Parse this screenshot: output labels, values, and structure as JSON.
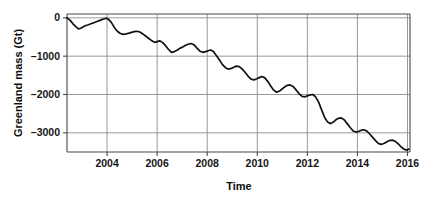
{
  "chart_data": {
    "type": "line",
    "title": "",
    "xlabel": "Time",
    "ylabel": "Greenland mass (Gt)",
    "xlim": [
      2002.4,
      2016.1
    ],
    "ylim": [
      -3500,
      100
    ],
    "grid": true,
    "legend": "none",
    "xticks": [
      2004,
      2006,
      2008,
      2010,
      2012,
      2014,
      2016
    ],
    "xtick_labels": [
      "2004",
      "2006",
      "2008",
      "2010",
      "2012",
      "2014",
      "2016"
    ],
    "yticks": [
      0,
      -1000,
      -2000,
      -3000
    ],
    "ytick_labels": [
      "0",
      "–1000",
      "–2000",
      "–3000"
    ],
    "series": [
      {
        "name": "Greenland ice sheet mass anomaly",
        "color": "#111111",
        "x": [
          2002.4,
          2002.52,
          2002.63,
          2002.75,
          2002.86,
          2002.95,
          2003.05,
          2003.15,
          2003.26,
          2003.38,
          2003.5,
          2003.62,
          2003.74,
          2003.86,
          2003.96,
          2004.06,
          2004.17,
          2004.29,
          2004.41,
          2004.53,
          2004.65,
          2004.77,
          2004.88,
          2004.98,
          2005.08,
          2005.19,
          2005.31,
          2005.43,
          2005.55,
          2005.67,
          2005.79,
          2005.9,
          2006.0,
          2006.1,
          2006.21,
          2006.33,
          2006.45,
          2006.57,
          2006.69,
          2006.81,
          2006.92,
          2007.02,
          2007.12,
          2007.23,
          2007.35,
          2007.47,
          2007.59,
          2007.71,
          2007.83,
          2007.94,
          2008.04,
          2008.14,
          2008.25,
          2008.37,
          2008.49,
          2008.61,
          2008.73,
          2008.85,
          2008.96,
          2009.06,
          2009.16,
          2009.27,
          2009.39,
          2009.51,
          2009.63,
          2009.75,
          2009.87,
          2009.98,
          2010.08,
          2010.18,
          2010.29,
          2010.41,
          2010.53,
          2010.65,
          2010.77,
          2010.89,
          2011.0,
          2011.1,
          2011.2,
          2011.31,
          2011.43,
          2011.55,
          2011.67,
          2011.79,
          2011.91,
          2012.02,
          2012.12,
          2012.22,
          2012.33,
          2012.45,
          2012.57,
          2012.69,
          2012.81,
          2012.93,
          2013.04,
          2013.14,
          2013.24,
          2013.35,
          2013.47,
          2013.59,
          2013.71,
          2013.83,
          2013.95,
          2014.06,
          2014.16,
          2014.26,
          2014.37,
          2014.49,
          2014.61,
          2014.73,
          2014.85,
          2014.97,
          2015.08,
          2015.18,
          2015.28,
          2015.39,
          2015.51,
          2015.63,
          2015.75,
          2015.87,
          2015.99,
          2016.05
        ],
        "y": [
          0,
          -60,
          -150,
          -230,
          -290,
          -270,
          -230,
          -200,
          -180,
          -150,
          -120,
          -90,
          -60,
          -30,
          -10,
          -40,
          -120,
          -250,
          -350,
          -410,
          -430,
          -420,
          -400,
          -380,
          -360,
          -350,
          -370,
          -420,
          -480,
          -540,
          -600,
          -640,
          -620,
          -600,
          -640,
          -720,
          -820,
          -900,
          -880,
          -840,
          -790,
          -760,
          -720,
          -690,
          -670,
          -700,
          -790,
          -870,
          -900,
          -880,
          -860,
          -840,
          -880,
          -990,
          -1100,
          -1220,
          -1300,
          -1340,
          -1320,
          -1290,
          -1260,
          -1270,
          -1330,
          -1420,
          -1520,
          -1600,
          -1620,
          -1590,
          -1560,
          -1530,
          -1560,
          -1650,
          -1770,
          -1880,
          -1940,
          -1910,
          -1850,
          -1800,
          -1760,
          -1750,
          -1790,
          -1880,
          -1980,
          -2050,
          -2060,
          -2030,
          -2010,
          -2000,
          -2060,
          -2200,
          -2400,
          -2600,
          -2720,
          -2760,
          -2720,
          -2660,
          -2620,
          -2610,
          -2660,
          -2760,
          -2860,
          -2950,
          -2980,
          -2960,
          -2930,
          -2920,
          -2950,
          -3030,
          -3120,
          -3210,
          -3280,
          -3300,
          -3270,
          -3230,
          -3200,
          -3190,
          -3220,
          -3290,
          -3370,
          -3430,
          -3450,
          -3420
        ]
      }
    ]
  },
  "axis": {
    "ylabel": "Greenland mass (Gt)",
    "xlabel": "Time"
  }
}
